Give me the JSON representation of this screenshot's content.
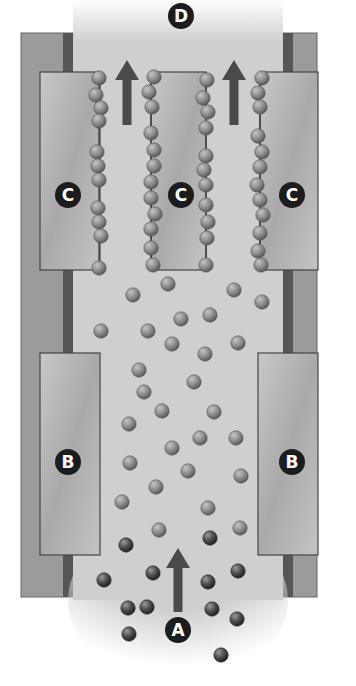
{
  "diagram": {
    "labels": [
      {
        "id": "D",
        "text": "D",
        "x": 181,
        "y": 16
      },
      {
        "id": "C-left",
        "text": "C",
        "x": 68,
        "y": 195
      },
      {
        "id": "C-middle",
        "text": "C",
        "x": 181,
        "y": 195
      },
      {
        "id": "C-right",
        "text": "C",
        "x": 292,
        "y": 195
      },
      {
        "id": "B-left",
        "text": "B",
        "x": 68,
        "y": 462
      },
      {
        "id": "B-right",
        "text": "B",
        "x": 292,
        "y": 462
      },
      {
        "id": "A",
        "text": "A",
        "x": 178,
        "y": 630
      }
    ],
    "arrows": [
      {
        "id": "flow-arrow-top-left",
        "x": 127,
        "y_tail": 125,
        "y_head": 60
      },
      {
        "id": "flow-arrow-top-right",
        "x": 234,
        "y_tail": 125,
        "y_head": 60
      },
      {
        "id": "flow-arrow-bottom",
        "x": 178,
        "y_tail": 612,
        "y_head": 548
      }
    ],
    "plates": {
      "C": [
        {
          "id": "plate-c-left",
          "x": 40,
          "y": 72,
          "w": 60,
          "h": 198
        },
        {
          "id": "plate-c-middle",
          "x": 151,
          "y": 72,
          "w": 55,
          "h": 198
        },
        {
          "id": "plate-c-right",
          "x": 260,
          "y": 72,
          "w": 58,
          "h": 198
        }
      ],
      "B": [
        {
          "id": "plate-b-left",
          "x": 40,
          "y": 353,
          "w": 60,
          "h": 202
        },
        {
          "id": "plate-b-right",
          "x": 258,
          "y": 353,
          "w": 60,
          "h": 202
        }
      ]
    },
    "chains": [
      {
        "id": "chain-1",
        "x": 99,
        "beads_y": [
          78,
          95,
          108,
          121,
          152,
          166,
          180,
          208,
          222,
          236,
          268
        ],
        "dx": [
          0,
          -3,
          2,
          0,
          -2,
          -1,
          0,
          -1,
          0,
          2,
          0
        ]
      },
      {
        "id": "chain-2",
        "x": 151,
        "beads_y": [
          77,
          92,
          107,
          133,
          150,
          166,
          182,
          198,
          214,
          229,
          248,
          265
        ],
        "dx": [
          3,
          -2,
          1,
          0,
          3,
          3,
          0,
          0,
          4,
          0,
          0,
          2
        ]
      },
      {
        "id": "chain-3",
        "x": 206,
        "beads_y": [
          80,
          98,
          112,
          128,
          156,
          170,
          185,
          205,
          222,
          238,
          265
        ],
        "dx": [
          1,
          -3,
          2,
          0,
          0,
          -2,
          0,
          0,
          2,
          1,
          0
        ]
      },
      {
        "id": "chain-4",
        "x": 260,
        "beads_y": [
          78,
          93,
          107,
          136,
          152,
          167,
          185,
          200,
          215,
          233,
          251,
          265
        ],
        "dx": [
          2,
          -2,
          0,
          -2,
          2,
          0,
          -3,
          0,
          3,
          0,
          -2,
          1
        ]
      }
    ],
    "particles_light": [
      [
        168,
        284
      ],
      [
        133,
        295
      ],
      [
        234,
        290
      ],
      [
        262,
        302
      ],
      [
        101,
        331
      ],
      [
        148,
        331
      ],
      [
        181,
        319
      ],
      [
        210,
        315
      ],
      [
        172,
        344
      ],
      [
        238,
        343
      ],
      [
        139,
        370
      ],
      [
        205,
        354
      ],
      [
        144,
        392
      ],
      [
        194,
        382
      ],
      [
        162,
        411
      ],
      [
        214,
        412
      ],
      [
        129,
        424
      ],
      [
        172,
        448
      ],
      [
        200,
        438
      ],
      [
        236,
        438
      ],
      [
        130,
        463
      ],
      [
        156,
        487
      ],
      [
        188,
        471
      ],
      [
        241,
        476
      ],
      [
        122,
        502
      ],
      [
        159,
        530
      ],
      [
        208,
        508
      ],
      [
        240,
        528
      ]
    ],
    "particles_dark": [
      [
        126,
        545
      ],
      [
        210,
        538
      ],
      [
        238,
        571
      ],
      [
        104,
        580
      ],
      [
        153,
        573
      ],
      [
        208,
        582
      ],
      [
        128,
        608
      ],
      [
        147,
        607
      ],
      [
        212,
        609
      ],
      [
        237,
        619
      ],
      [
        129,
        634
      ],
      [
        221,
        655
      ]
    ],
    "colors": {
      "channel": "#cfcfcf",
      "wall": "#9b9b9b",
      "wall_dark_strip": "#565656",
      "plate": "#b9b9b9",
      "plate_border": "#444444",
      "arrow": "#4a4a4a",
      "label_bg": "#1c1c1c",
      "label_text": "#ffffff",
      "bead_light": "#8a8a8a",
      "bead_dark": "#4d4d4d"
    }
  }
}
